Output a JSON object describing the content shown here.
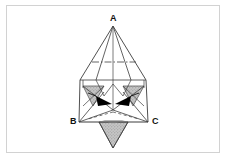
{
  "figure": {
    "background_color": "#ffffff",
    "frame_color": "#d2d2d2",
    "line_color": "#3c3c3c",
    "shade_fill": "#b9b9b9",
    "arrow_fill": "#000000",
    "labels": [
      {
        "id": "A",
        "text": "A",
        "x": 110,
        "y": 14
      },
      {
        "id": "B",
        "text": "B",
        "x": 70,
        "y": 117
      },
      {
        "id": "C",
        "text": "C",
        "x": 152,
        "y": 117
      }
    ],
    "vertices": {
      "apex_A": {
        "x": 113,
        "y": 26
      },
      "left_B": {
        "x": 79,
        "y": 122
      },
      "right_C": {
        "x": 148,
        "y": 122
      },
      "center": {
        "x": 113,
        "y": 110
      },
      "bottom_tip": {
        "x": 113,
        "y": 148
      }
    },
    "annotations": {
      "arrow_left": "inward-pointing arrowhead",
      "arrow_right": "inward-pointing arrowhead",
      "centerline": "vertical axis through apex A",
      "dash_dot_line": "horizontal construction line"
    }
  }
}
